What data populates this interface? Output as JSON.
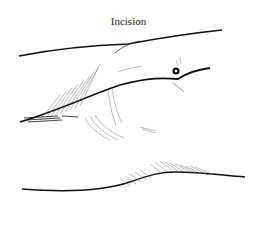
{
  "figure": {
    "title": "Incision",
    "colors": {
      "ink": "#111111",
      "hatch": "#777777",
      "background": "#ffffff"
    }
  }
}
